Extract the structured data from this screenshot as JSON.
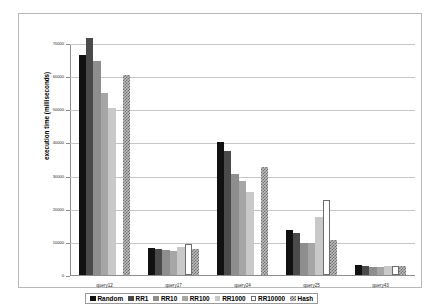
{
  "chart_data": {
    "type": "bar",
    "title": "",
    "xlabel": "",
    "ylabel": "execution time (milliseconds)",
    "ylim": [
      0,
      70000
    ],
    "ytick_values": [
      0,
      10000,
      20000,
      30000,
      40000,
      50000,
      60000,
      70000
    ],
    "ytick_labels": [
      "0",
      "10000",
      "20000",
      "30000",
      "40000",
      "50000",
      "60000",
      "70000"
    ],
    "grid": true,
    "legend_position": "bottom",
    "categories": [
      "query12",
      "query17",
      "query24",
      "query25",
      "query43"
    ],
    "series": [
      {
        "name": "Random",
        "color": "#111111",
        "values": [
          66500,
          8200,
          40000,
          13500,
          3000
        ]
      },
      {
        "name": "RR1",
        "color": "#4a4a4a",
        "values": [
          71500,
          7800,
          37500,
          12800,
          2700
        ]
      },
      {
        "name": "RR10",
        "color": "#8e8e8e",
        "values": [
          64500,
          7400,
          30500,
          9700,
          2400
        ]
      },
      {
        "name": "RR100",
        "color": "#a6a6a6",
        "values": [
          55000,
          7200,
          28500,
          9600,
          2500
        ]
      },
      {
        "name": "RR1000",
        "color": "#c9c9c9",
        "values": [
          50500,
          8600,
          25000,
          17500,
          2600
        ]
      },
      {
        "name": "RR10000",
        "color": "#ffffff",
        "values": [
          0,
          9300,
          0,
          22500,
          2700
        ]
      },
      {
        "name": "Hash",
        "color": "#bdbdbd",
        "values": [
          60500,
          7700,
          32500,
          10500,
          2600
        ]
      }
    ]
  }
}
